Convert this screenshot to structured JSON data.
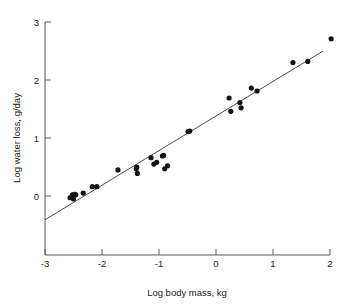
{
  "chart_data": {
    "type": "scatter",
    "title": "",
    "xlabel": "Log body mass, kg",
    "ylabel": "Log water loss, g/day",
    "xlim": [
      -3,
      2
    ],
    "ylim": [
      -0.5,
      3
    ],
    "xticks": [
      -3,
      -2,
      -1,
      0,
      1,
      2
    ],
    "xtick_labels": [
      "-3",
      "-2",
      "-1",
      "0",
      "1",
      "2"
    ],
    "yticks": [
      0,
      1,
      2,
      3
    ],
    "ytick_labels": [
      "0",
      "1",
      "2",
      "3"
    ],
    "grid": false,
    "legend": null,
    "point_color": "#141414",
    "line_color": "#3a3a3a",
    "axis_color": "#4a4a4a",
    "points": [
      {
        "x": -2.56,
        "y": -0.03
      },
      {
        "x": -2.52,
        "y": 0.02
      },
      {
        "x": -2.5,
        "y": -0.05
      },
      {
        "x": -2.48,
        "y": 0.03
      },
      {
        "x": -2.46,
        "y": 0.02
      },
      {
        "x": -2.33,
        "y": 0.05
      },
      {
        "x": -2.17,
        "y": 0.16
      },
      {
        "x": -2.09,
        "y": 0.16
      },
      {
        "x": -1.72,
        "y": 0.45
      },
      {
        "x": -1.4,
        "y": 0.47
      },
      {
        "x": -1.39,
        "y": 0.5
      },
      {
        "x": -1.38,
        "y": 0.39
      },
      {
        "x": -1.14,
        "y": 0.66
      },
      {
        "x": -1.09,
        "y": 0.55
      },
      {
        "x": -1.04,
        "y": 0.58
      },
      {
        "x": -0.94,
        "y": 0.69
      },
      {
        "x": -0.92,
        "y": 0.7
      },
      {
        "x": -0.9,
        "y": 0.47
      },
      {
        "x": -0.85,
        "y": 0.52
      },
      {
        "x": -0.49,
        "y": 1.11
      },
      {
        "x": -0.46,
        "y": 1.12
      },
      {
        "x": 0.23,
        "y": 1.69
      },
      {
        "x": 0.26,
        "y": 1.46
      },
      {
        "x": 0.42,
        "y": 1.61
      },
      {
        "x": 0.44,
        "y": 1.52
      },
      {
        "x": 0.62,
        "y": 1.86
      },
      {
        "x": 0.72,
        "y": 1.81
      },
      {
        "x": 1.35,
        "y": 2.3
      },
      {
        "x": 1.61,
        "y": 2.32
      },
      {
        "x": 2.02,
        "y": 2.71
      }
    ],
    "fit_line": {
      "x_start": -3.0,
      "y_start": -0.41,
      "x_end": 1.88,
      "y_end": 2.5
    }
  }
}
